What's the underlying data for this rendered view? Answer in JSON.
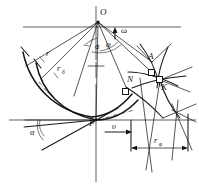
{
  "figure": {
    "type": "line-diagram",
    "background": "#ffffff",
    "ink_color": "#121212",
    "width": 199,
    "height": 187
  },
  "points": [
    {
      "id": "O",
      "label": "O",
      "x": 98,
      "y": 20,
      "role": "center-of-rotation"
    },
    {
      "id": "A",
      "label": "A",
      "x": 152,
      "y": 62,
      "role": "upper-intersection"
    },
    {
      "id": "K",
      "label": "K",
      "x": 160,
      "y": 80,
      "role": "contact-point"
    },
    {
      "id": "N",
      "label": "N",
      "x": 126,
      "y": 87,
      "role": "normal-point"
    },
    {
      "id": "P",
      "label": "P",
      "x": 96,
      "y": 120,
      "role": "pitch-point"
    }
  ],
  "symbols": [
    {
      "id": "omega",
      "label": "ω",
      "x": 120,
      "y": 31,
      "role": "angular-velocity"
    },
    {
      "id": "phi",
      "label": "φ",
      "x": 107,
      "y": 45,
      "role": "rotation-angle"
    },
    {
      "id": "alpha_top",
      "label": "α",
      "x": 98,
      "y": 47,
      "role": "clearance-angle-at-O"
    },
    {
      "id": "alpha_bottom",
      "label": "α",
      "x": 33,
      "y": 132,
      "role": "clearance-angle-at-P"
    },
    {
      "id": "v",
      "label": "υ",
      "x": 113,
      "y": 126,
      "role": "feed-velocity"
    }
  ],
  "radii": [
    {
      "id": "r",
      "base": "r",
      "sub": "",
      "x": 48,
      "y": 55,
      "role": "outer-radius"
    },
    {
      "id": "r_b",
      "base": "r",
      "sub": "б",
      "x": 60,
      "y": 71,
      "role": "base-radius"
    },
    {
      "id": "r_phi",
      "base": "r",
      "sub": "φ",
      "x": 158,
      "y": 142,
      "role": "instantaneous-radius"
    }
  ],
  "axes": [
    {
      "id": "horizontal-through-O",
      "orientation": "horizontal",
      "y": 27,
      "x1": 22,
      "x2": 182
    },
    {
      "id": "vertical-center",
      "orientation": "vertical",
      "x": 96,
      "y1": 6,
      "y2": 182
    },
    {
      "id": "horizontal-through-P",
      "orientation": "horizontal",
      "y": 120,
      "x1": 8,
      "x2": 196
    }
  ],
  "dimension": {
    "id": "r-phi-dimension",
    "label": "rφ",
    "from_x": 131,
    "to_x": 188,
    "y": 148
  },
  "curves": [
    {
      "id": "outer-arc",
      "role": "tool-flank-arc"
    },
    {
      "id": "inner-arc",
      "role": "cutting-edge-arc"
    },
    {
      "id": "trochoid",
      "role": "trochoidal-path"
    },
    {
      "id": "workpiece",
      "role": "workpiece-surface"
    }
  ]
}
